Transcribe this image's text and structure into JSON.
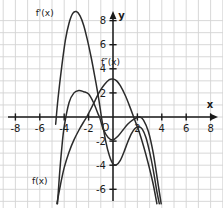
{
  "figure": {
    "type": "line-graph",
    "background": "#ffffff",
    "grid_color": "#d4d4d4",
    "axis_color": "#1a1a1a",
    "curve_color": "#2b2b2b"
  },
  "axes": {
    "x_axis_label": "x",
    "y_axis_label": "y",
    "origin_label": "O",
    "x_ticks": [
      -8,
      -6,
      -4,
      -2,
      2,
      4,
      6,
      8
    ],
    "x_tick_labels": [
      "-8",
      "-6",
      "-4",
      "-2",
      "2",
      "4",
      "6",
      "8"
    ],
    "y_ticks": [
      8,
      6,
      4,
      2,
      -2,
      -4,
      -6
    ],
    "y_tick_labels": [
      "8",
      "6",
      "4",
      "2",
      "-2",
      "-4",
      "-6"
    ],
    "xlim": [
      -9.4,
      8.8
    ],
    "ylim": [
      -7.2,
      8.9
    ],
    "grid": true
  },
  "curve_labels": {
    "f": "f(x)",
    "f_prime": "f'(x)",
    "f_double_prime": "f″(x)"
  },
  "chart_data": {
    "type": "line",
    "title": "",
    "xlabel": "x",
    "ylabel": "y",
    "xlim": [
      -9.4,
      8.8
    ],
    "ylim": [
      -7.2,
      8.9
    ],
    "grid": true,
    "legend": "inline-curve-labels",
    "series": [
      {
        "name": "f(x)",
        "label": "f(x)",
        "description": "steeply rising then falling cubic-like curve crossing zero near x=-1.1 and x=2.2",
        "points": [
          [
            -4.55,
            -7.2
          ],
          [
            -4.4,
            -5.0
          ],
          [
            -4.2,
            -2.6
          ],
          [
            -4.0,
            -0.8
          ],
          [
            -3.6,
            1.2
          ],
          [
            -3.2,
            2.0
          ],
          [
            -2.8,
            2.2
          ],
          [
            -2.4,
            2.1
          ],
          [
            -2.0,
            1.9
          ],
          [
            -1.6,
            1.2
          ],
          [
            -1.2,
            0.2
          ],
          [
            -1.1,
            0.0
          ],
          [
            -0.8,
            -1.0
          ],
          [
            -0.4,
            -1.7
          ],
          [
            0.0,
            -1.9
          ],
          [
            0.4,
            -1.6
          ],
          [
            0.8,
            -1.1
          ],
          [
            1.2,
            -0.6
          ],
          [
            1.6,
            -0.25
          ],
          [
            2.0,
            -0.05
          ],
          [
            2.2,
            0.0
          ],
          [
            2.5,
            -0.25
          ],
          [
            2.9,
            -1.2
          ],
          [
            3.3,
            -3.0
          ],
          [
            3.7,
            -5.6
          ],
          [
            3.95,
            -7.2
          ]
        ]
      },
      {
        "name": "f'(x)",
        "label": "f'(x)",
        "description": "downward parabola-like derivative peaking near (-3, 8.7), crossing zero near x=-4.6 and x=-1.2",
        "points": [
          [
            -4.7,
            -0.6
          ],
          [
            -4.5,
            1.6
          ],
          [
            -4.2,
            4.2
          ],
          [
            -3.9,
            6.4
          ],
          [
            -3.6,
            7.8
          ],
          [
            -3.3,
            8.6
          ],
          [
            -3.0,
            8.75
          ],
          [
            -2.7,
            8.4
          ],
          [
            -2.4,
            7.6
          ],
          [
            -2.1,
            6.4
          ],
          [
            -1.8,
            5.0
          ],
          [
            -1.5,
            3.4
          ],
          [
            -1.2,
            1.7
          ],
          [
            -1.05,
            0.7
          ],
          [
            -0.9,
            -0.3
          ],
          [
            -0.6,
            -2.0
          ],
          [
            -0.3,
            -3.2
          ],
          [
            0.0,
            -3.9
          ],
          [
            0.3,
            -3.95
          ],
          [
            0.6,
            -3.6
          ],
          [
            0.9,
            -2.9
          ],
          [
            1.2,
            -2.1
          ],
          [
            1.5,
            -1.4
          ],
          [
            1.8,
            -0.95
          ],
          [
            2.1,
            -0.8
          ],
          [
            2.4,
            -1.0
          ],
          [
            2.7,
            -1.7
          ],
          [
            3.0,
            -2.9
          ],
          [
            3.3,
            -4.4
          ],
          [
            3.6,
            -6.2
          ],
          [
            3.8,
            -7.2
          ]
        ]
      },
      {
        "name": "f″(x)",
        "label": "f″(x)",
        "description": "steep rising line crossing zero near x=-2.15 then turning down after x=0.6",
        "points": [
          [
            -4.6,
            -7.2
          ],
          [
            -4.3,
            -5.6
          ],
          [
            -4.0,
            -4.2
          ],
          [
            -3.6,
            -2.9
          ],
          [
            -3.2,
            -1.9
          ],
          [
            -2.8,
            -1.1
          ],
          [
            -2.4,
            -0.4
          ],
          [
            -2.15,
            0.0
          ],
          [
            -1.9,
            0.5
          ],
          [
            -1.5,
            1.3
          ],
          [
            -1.1,
            2.1
          ],
          [
            -0.7,
            2.7
          ],
          [
            -0.3,
            3.1
          ],
          [
            0.0,
            3.15
          ],
          [
            0.3,
            3.0
          ],
          [
            0.6,
            2.6
          ],
          [
            1.0,
            1.8
          ],
          [
            1.4,
            0.8
          ],
          [
            1.8,
            -0.3
          ],
          [
            2.1,
            -1.1
          ],
          [
            2.5,
            -2.4
          ],
          [
            2.9,
            -3.9
          ],
          [
            3.3,
            -5.6
          ],
          [
            3.6,
            -7.2
          ]
        ]
      }
    ],
    "label_positions": {
      "f(x)": [
        -6.0,
        -5.6
      ],
      "f'(x)": [
        -5.6,
        8.4
      ],
      "f″(x)": [
        -0.2,
        4.3
      ]
    }
  }
}
